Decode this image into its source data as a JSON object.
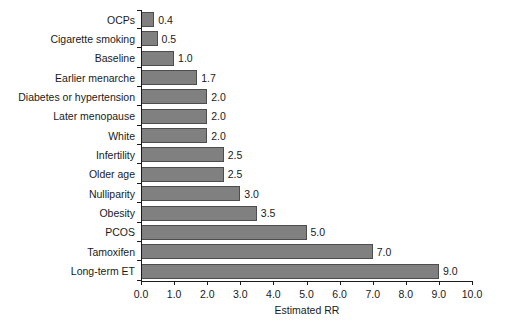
{
  "chart_data": {
    "type": "bar",
    "orientation": "horizontal",
    "title": "",
    "xlabel": "Estimated RR",
    "ylabel": "",
    "xlim": [
      0.0,
      10.0
    ],
    "xticks": [
      "0.0",
      "1.0",
      "2.0",
      "3.0",
      "4.0",
      "5.0",
      "6.0",
      "7.0",
      "8.0",
      "9.0",
      "10.0"
    ],
    "xtick_values": [
      0,
      1,
      2,
      3,
      4,
      5,
      6,
      7,
      8,
      9,
      10
    ],
    "grid": false,
    "legend": null,
    "categories": [
      "OCPs",
      "Cigarette smoking",
      "Baseline",
      "Earlier menarche",
      "Diabetes or hypertension",
      "Later menopause",
      "White",
      "Infertility",
      "Older age",
      "Nulliparity",
      "Obesity",
      "PCOS",
      "Tamoxifen",
      "Long-term ET"
    ],
    "values": [
      0.4,
      0.5,
      1.0,
      1.7,
      2.0,
      2.0,
      2.0,
      2.5,
      2.5,
      3.0,
      3.5,
      5.0,
      7.0,
      9.0
    ],
    "value_labels": [
      "0.4",
      "0.5",
      "1.0",
      "1.7",
      "2.0",
      "2.0",
      "2.0",
      "2.5",
      "2.5",
      "3.0",
      "3.5",
      "5.0",
      "7.0",
      "9.0"
    ],
    "bar_color": "#808080",
    "bar_edge_color": "#4d4d4d",
    "axis_color": "#1a1a1a",
    "background_color": "#ffffff"
  }
}
